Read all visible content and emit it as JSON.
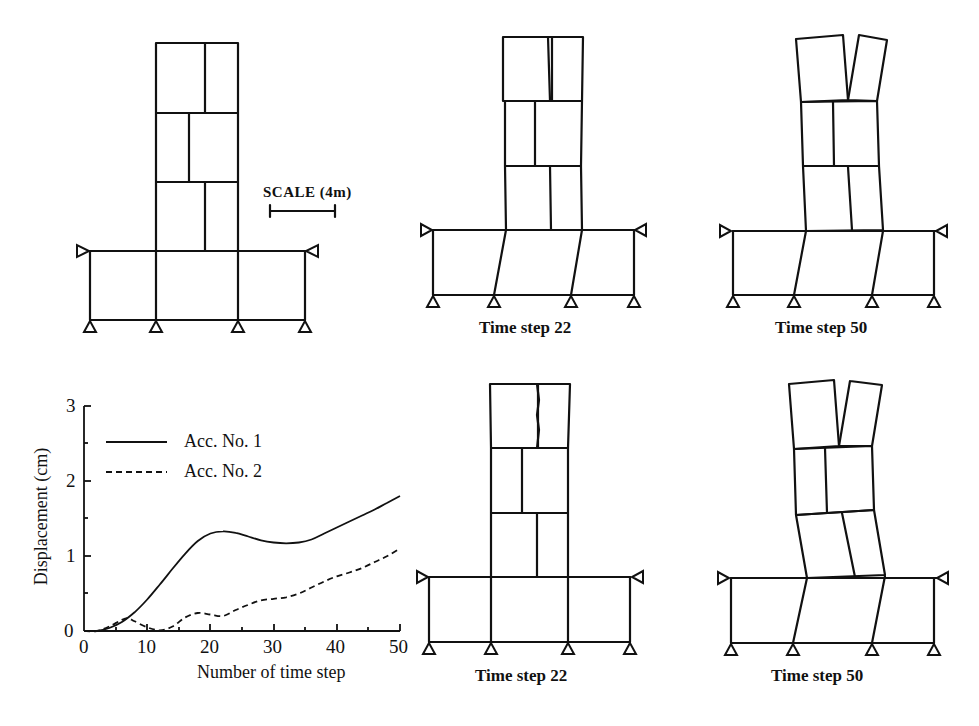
{
  "figure": {
    "scale_label": "SCALE (4m)",
    "panels": [
      {
        "id": "original",
        "caption": ""
      },
      {
        "id": "top-mid",
        "caption": "Time step 22"
      },
      {
        "id": "top-right",
        "caption": "Time step 50"
      },
      {
        "id": "bottom-mid",
        "caption": "Time step 22"
      },
      {
        "id": "bottom-right",
        "caption": "Time step 50"
      }
    ]
  },
  "chart_data": {
    "type": "line",
    "title": "",
    "xlabel": "Number of time step",
    "ylabel": "Displacement (cm)",
    "xlim": [
      0,
      50
    ],
    "ylim": [
      0,
      3
    ],
    "xticks": [
      "0",
      "10",
      "20",
      "30",
      "40",
      "50"
    ],
    "yticks": [
      "0",
      "1",
      "2",
      "3"
    ],
    "grid": false,
    "legend_position": "upper-left",
    "series": [
      {
        "name": "Acc. No. 1",
        "style": "solid",
        "x": [
          0,
          2,
          4,
          6,
          8,
          10,
          12,
          14,
          16,
          18,
          20,
          22,
          24,
          26,
          28,
          30,
          32,
          34,
          36,
          38,
          40,
          42,
          44,
          46,
          48,
          50
        ],
        "values": [
          0,
          0.0,
          0.04,
          0.12,
          0.25,
          0.42,
          0.62,
          0.83,
          1.03,
          1.2,
          1.3,
          1.33,
          1.31,
          1.26,
          1.21,
          1.18,
          1.17,
          1.18,
          1.22,
          1.3,
          1.38,
          1.46,
          1.54,
          1.62,
          1.71,
          1.8
        ]
      },
      {
        "name": "Acc. No. 2",
        "style": "dashed",
        "x": [
          0,
          2,
          4,
          6,
          7,
          8,
          10,
          12,
          14,
          16,
          18,
          20,
          22,
          24,
          26,
          28,
          30,
          32,
          34,
          36,
          38,
          40,
          42,
          44,
          46,
          48,
          50
        ],
        "values": [
          0,
          0.0,
          0.06,
          0.15,
          0.17,
          0.13,
          0.05,
          0.01,
          0.06,
          0.18,
          0.24,
          0.22,
          0.2,
          0.28,
          0.35,
          0.41,
          0.43,
          0.45,
          0.5,
          0.58,
          0.66,
          0.73,
          0.78,
          0.84,
          0.92,
          1.0,
          1.1
        ]
      }
    ]
  }
}
